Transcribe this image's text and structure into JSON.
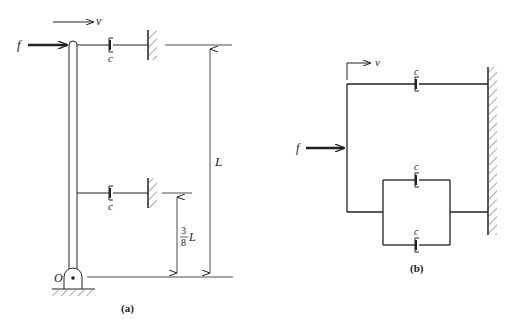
{
  "figure_a": {
    "caption": "(a)",
    "force_label": "f",
    "velocity_label": "v",
    "top_damper_label": "c",
    "mid_damper_label": "c",
    "pivot_label": "O",
    "length_label": "L",
    "fraction_numerator": "3",
    "fraction_denominator": "8",
    "fraction_suffix": "L"
  },
  "figure_b": {
    "caption": "(b)",
    "force_label": "f",
    "velocity_label": "v",
    "top_damper_label": "c",
    "parallel_upper_damper_label": "c",
    "parallel_lower_damper_label": "c"
  },
  "colors": {
    "line": "#222222",
    "hatch": "#555555",
    "background": "#ffffff"
  }
}
